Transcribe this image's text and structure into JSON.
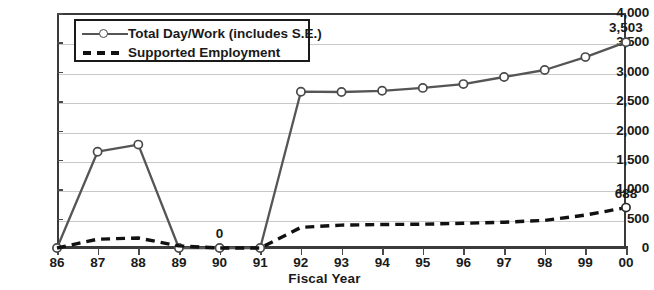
{
  "chart_data": {
    "type": "line",
    "title": "",
    "xlabel": "Fiscal Year",
    "ylabel": "",
    "categories": [
      "86",
      "87",
      "88",
      "89",
      "90",
      "91",
      "92",
      "93",
      "94",
      "95",
      "96",
      "97",
      "98",
      "99",
      "00"
    ],
    "ylim": [
      0,
      4000
    ],
    "ytick_labels": [
      "0",
      "500",
      "1,000",
      "1,500",
      "2,000",
      "2,500",
      "3,000",
      "3,500",
      "4,000"
    ],
    "ytick_values": [
      0,
      500,
      1000,
      1500,
      2000,
      2500,
      3000,
      3500,
      4000
    ],
    "grid": true,
    "legend_position": "top-left-inside",
    "series": [
      {
        "name": "Total Day/Work (includes S.E.)",
        "style": "solid",
        "marker": "open-circle",
        "color": "#555555",
        "values": [
          0,
          1640,
          1760,
          0,
          0,
          0,
          2660,
          2655,
          2675,
          2725,
          2790,
          2910,
          3030,
          3250,
          3503
        ]
      },
      {
        "name": "Supported Employment",
        "style": "dashed",
        "marker": "none",
        "color": "#111111",
        "values": [
          0,
          150,
          170,
          35,
          0,
          0,
          350,
          390,
          400,
          405,
          420,
          440,
          470,
          560,
          688
        ]
      }
    ],
    "annotations": [
      {
        "label": "0",
        "series": 0,
        "category": "90",
        "value": 0,
        "position": "above"
      },
      {
        "label": "3,503",
        "series": 0,
        "category": "00",
        "value": 3503,
        "position": "above"
      },
      {
        "label": "688",
        "series": 1,
        "category": "00",
        "value": 688,
        "position": "above"
      }
    ]
  },
  "axis": {
    "x_title": "Fiscal Year"
  },
  "legend": {
    "items": [
      {
        "label": "Total Day/Work (includes S.E.)",
        "key": "solid-line-open-circle-marker"
      },
      {
        "label": "Supported Employment",
        "key": "dashed-line"
      }
    ]
  }
}
